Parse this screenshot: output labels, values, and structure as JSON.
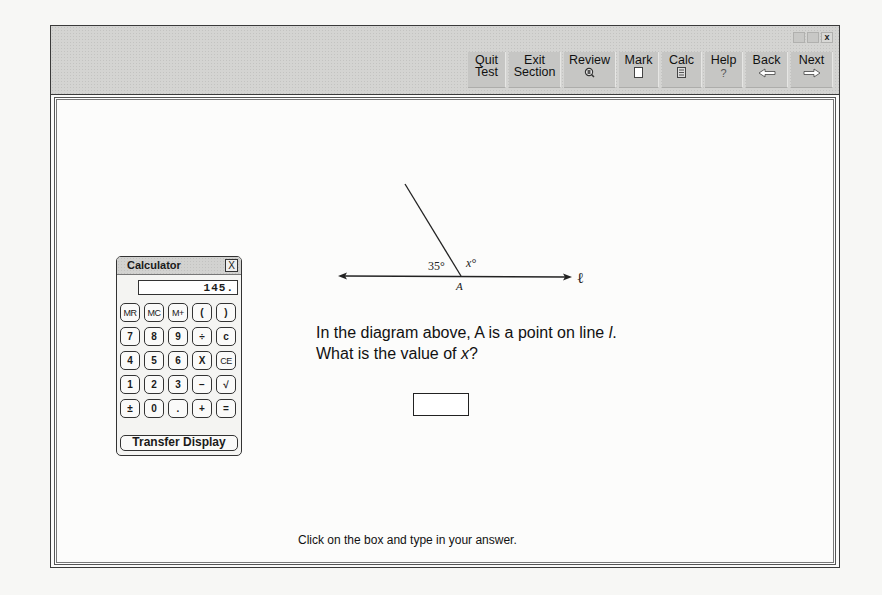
{
  "window_controls": [
    "minimize",
    "maximize",
    "close"
  ],
  "toolbar": {
    "buttons": [
      {
        "id": "quit",
        "line1": "Quit",
        "line2": "Test",
        "icon": null
      },
      {
        "id": "exit",
        "line1": "Exit",
        "line2": "Section",
        "icon": null
      },
      {
        "id": "review",
        "line1": "Review",
        "line2": "",
        "icon": "review-icon"
      },
      {
        "id": "mark",
        "line1": "Mark",
        "line2": "",
        "icon": "mark-icon"
      },
      {
        "id": "calc",
        "line1": "Calc",
        "line2": "",
        "icon": "calculator-icon"
      },
      {
        "id": "help",
        "line1": "Help",
        "line2": "?",
        "icon": "question-icon"
      },
      {
        "id": "back",
        "line1": "Back",
        "line2": "",
        "icon": "left-arrow-icon"
      },
      {
        "id": "next",
        "line1": "Next",
        "line2": "",
        "icon": "right-arrow-icon"
      }
    ],
    "close_glyph": "x"
  },
  "calculator": {
    "title": "Calculator",
    "close_label": "X",
    "display": "145.",
    "keys": [
      [
        "MR",
        "MC",
        "M+",
        "(",
        ")"
      ],
      [
        "7",
        "8",
        "9",
        "÷",
        "c"
      ],
      [
        "4",
        "5",
        "6",
        "X",
        "CE"
      ],
      [
        "1",
        "2",
        "3",
        "−",
        "√"
      ],
      [
        "±",
        "0",
        ".",
        "+",
        "="
      ]
    ],
    "transfer_label": "Transfer Display"
  },
  "diagram": {
    "angle_left": "35°",
    "angle_right": "x°",
    "point_label": "A",
    "line_label": "ℓ"
  },
  "question": {
    "line1_prefix": "In the diagram above, A is a point on line ",
    "line1_var": "l",
    "line1_suffix": ".",
    "line2_prefix": "What is the value of ",
    "line2_var": "x",
    "line2_suffix": "?"
  },
  "answer": {
    "value": ""
  },
  "instruction": "Click on the box and type in your answer."
}
